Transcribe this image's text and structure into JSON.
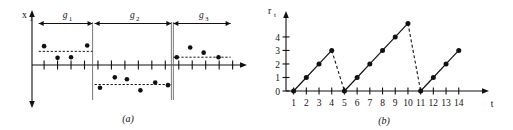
{
  "figure": {
    "panels": [
      {
        "id": "a",
        "caption": "(a)",
        "y_axis_label": "x",
        "y_axis_sublabel": "1",
        "groups": [
          {
            "label": "g",
            "sublabel": "1"
          },
          {
            "label": "g",
            "sublabel": "2"
          },
          {
            "label": "g",
            "sublabel": "3"
          }
        ]
      },
      {
        "id": "b",
        "caption": "(b)",
        "y_axis_label": "r",
        "y_axis_sublabel": "t",
        "x_axis_label": "t"
      }
    ]
  },
  "chart_data": [
    {
      "type": "scatter",
      "panel": "a",
      "title": "(a)",
      "xlabel": "",
      "ylabel": "x_1",
      "xlim": [
        0,
        15
      ],
      "ylim": [
        -3,
        3
      ],
      "grid": false,
      "legend": false,
      "x_tick_count": 15,
      "x_tick_labels": [],
      "y_tick_labels": [],
      "annotations": [
        "g_1",
        "g_2",
        "g_3"
      ],
      "groups": [
        {
          "name": "g_1",
          "label": "g",
          "sublabel": "1",
          "x_start": 0.35,
          "x_end": 4.35,
          "mean": 1.05,
          "points": [
            {
              "x": 0.75,
              "y": 1.45
            },
            {
              "x": 1.75,
              "y": 0.55
            },
            {
              "x": 2.75,
              "y": 0.6
            },
            {
              "x": 3.95,
              "y": 1.5
            }
          ]
        },
        {
          "name": "g_2",
          "label": "g",
          "sublabel": "2",
          "x_start": 4.5,
          "x_end": 10.2,
          "mean": -1.5,
          "points": [
            {
              "x": 4.9,
              "y": -1.75
            },
            {
              "x": 6.0,
              "y": -0.95
            },
            {
              "x": 6.9,
              "y": -1.1
            },
            {
              "x": 7.9,
              "y": -1.95
            },
            {
              "x": 9.0,
              "y": -1.35
            },
            {
              "x": 9.95,
              "y": -1.55
            }
          ]
        },
        {
          "name": "g_3",
          "label": "g",
          "sublabel": "3",
          "x_start": 10.35,
          "x_end": 14.6,
          "mean": 0.6,
          "points": [
            {
              "x": 10.6,
              "y": 0.6
            },
            {
              "x": 11.6,
              "y": 1.35
            },
            {
              "x": 12.6,
              "y": 0.95
            },
            {
              "x": 13.7,
              "y": 0.6
            }
          ]
        }
      ]
    },
    {
      "type": "line",
      "panel": "b",
      "title": "(b)",
      "xlabel": "t",
      "ylabel": "r_t",
      "xlim": [
        0.4,
        15.2
      ],
      "ylim": [
        0,
        5.4
      ],
      "grid": false,
      "legend": false,
      "x_tick_labels": [
        "1",
        "2",
        "3",
        "4",
        "5",
        "6",
        "7",
        "8",
        "9",
        "10",
        "11",
        "12",
        "13",
        "14"
      ],
      "y_tick_labels": [
        "0",
        "1",
        "2",
        "3",
        "4"
      ],
      "x": [
        1,
        2,
        3,
        4,
        5,
        6,
        7,
        8,
        9,
        10,
        11,
        12,
        13,
        14
      ],
      "values": [
        0,
        1,
        2,
        3,
        0,
        1,
        2,
        3,
        4,
        5,
        0,
        1,
        2,
        3
      ],
      "segments": [
        {
          "x": [
            1,
            2,
            3,
            4
          ],
          "y": [
            0,
            1,
            2,
            3
          ],
          "style": "solid"
        },
        {
          "x": [
            4,
            5
          ],
          "y": [
            3,
            0
          ],
          "style": "dashed"
        },
        {
          "x": [
            5,
            6,
            7,
            8,
            9,
            10
          ],
          "y": [
            0,
            1,
            2,
            3,
            4,
            5
          ],
          "style": "solid"
        },
        {
          "x": [
            10,
            11
          ],
          "y": [
            5,
            0
          ],
          "style": "dashed"
        },
        {
          "x": [
            11,
            12,
            13,
            14
          ],
          "y": [
            0,
            1,
            2,
            3
          ],
          "style": "solid"
        }
      ]
    }
  ]
}
